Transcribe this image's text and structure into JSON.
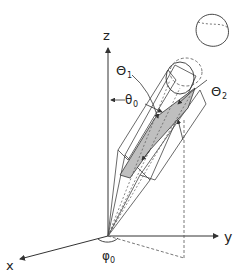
{
  "diagram": {
    "axes": {
      "z_label": "z",
      "y_label": "y",
      "x_label": "x"
    },
    "angles": {
      "theta0": "θ",
      "theta0_sub": "0",
      "phi0": "φ",
      "phi0_sub": "0",
      "Theta1": "Θ",
      "Theta1_sub": "1",
      "Theta2": "Θ",
      "Theta2_sub": "2"
    },
    "colors": {
      "line": "#333333",
      "shade": "#bfbfbf",
      "dash": "#555555"
    }
  }
}
